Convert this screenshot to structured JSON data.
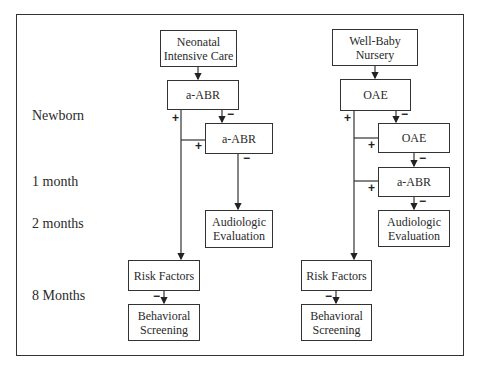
{
  "timeline": {
    "newborn": "Newborn",
    "one_month": "1 month",
    "two_months": "2 months",
    "eight_months": "8 Months"
  },
  "nicu": {
    "start": "Neonatal Intensive Care",
    "screen1": "a-ABR",
    "screen2": "a-ABR",
    "audiologic": "Audiologic Evaluation",
    "risk": "Risk Factors",
    "behavioral": "Behavioral Screening"
  },
  "wbn": {
    "start": "Well-Baby Nursery",
    "screen1": "OAE",
    "screen2": "OAE",
    "screen3": "a-ABR",
    "audiologic": "Audiologic Evaluation",
    "risk": "Risk Factors",
    "behavioral": "Behavioral Screening"
  },
  "signs": {
    "pass": "+",
    "refer": "−"
  }
}
